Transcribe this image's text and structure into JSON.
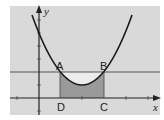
{
  "diagram": {
    "type": "parabola-inscribed-rectangle",
    "background_color": "#d9d9d9",
    "axes": {
      "x_label": "x",
      "y_label": "y"
    },
    "points": {
      "A": {
        "label": "A"
      },
      "B": {
        "label": "B"
      },
      "C": {
        "label": "C"
      },
      "D": {
        "label": "D"
      }
    },
    "colors": {
      "curve": "#1a1a1a",
      "rectangle_fill": "#9a9a9a",
      "region_above_curve": "#ececec",
      "line": "#555555"
    }
  }
}
